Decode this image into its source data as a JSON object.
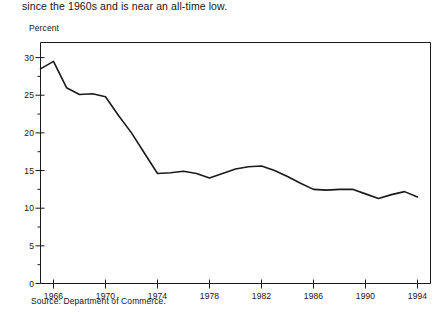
{
  "caption": {
    "text": "since the 1960s and is near an all-time low."
  },
  "source": {
    "text": "Source: Department of Commerce."
  },
  "chart_data": {
    "type": "line",
    "title": "",
    "subtitle": "",
    "xlabel": "",
    "ylabel": "Percent",
    "xlim": [
      1965,
      1995
    ],
    "ylim": [
      0,
      32
    ],
    "grid": false,
    "legend": false,
    "legend_position": "none",
    "y_ticks": [
      0,
      5,
      10,
      15,
      20,
      25,
      30
    ],
    "y_tick_labels": [
      "0",
      "5",
      "10",
      "15",
      "20",
      "25",
      "30"
    ],
    "y_minor_ticks": [
      2.5,
      7.5,
      12.5,
      17.5,
      22.5,
      27.5
    ],
    "x_ticks": [
      1966,
      1970,
      1974,
      1978,
      1982,
      1986,
      1990,
      1994
    ],
    "x_tick_labels": [
      "1966",
      "1970",
      "1974",
      "1978",
      "1982",
      "1986",
      "1990",
      "1994"
    ],
    "line_color": "#1a1a1a",
    "x": [
      1965,
      1966,
      1967,
      1968,
      1969,
      1970,
      1971,
      1972,
      1973,
      1974,
      1975,
      1976,
      1977,
      1978,
      1979,
      1980,
      1981,
      1982,
      1983,
      1984,
      1985,
      1986,
      1987,
      1988,
      1989,
      1990,
      1991,
      1992,
      1993,
      1994
    ],
    "values": [
      28.5,
      29.5,
      26.0,
      25.1,
      25.2,
      24.8,
      22.3,
      20.0,
      17.3,
      14.6,
      14.7,
      14.9,
      14.6,
      14.0,
      14.6,
      15.2,
      15.5,
      15.6,
      15.0,
      14.2,
      13.3,
      12.5,
      12.4,
      12.5,
      12.5,
      11.9,
      11.3,
      11.8,
      12.2,
      11.5
    ],
    "series": [
      {
        "name": "Percent",
        "values": [
          28.5,
          29.5,
          26.0,
          25.1,
          25.2,
          24.8,
          22.3,
          20.0,
          17.3,
          14.6,
          14.7,
          14.9,
          14.6,
          14.0,
          14.6,
          15.2,
          15.5,
          15.6,
          15.0,
          14.2,
          13.3,
          12.5,
          12.4,
          12.5,
          12.5,
          11.9,
          11.3,
          11.8,
          12.2,
          11.5
        ]
      }
    ]
  }
}
